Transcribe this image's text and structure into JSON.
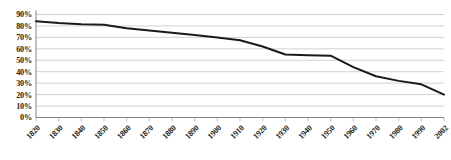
{
  "chart_data": {
    "type": "line",
    "title": "",
    "subtitle": "",
    "xlabel": "",
    "ylabel": "",
    "grid": true,
    "legend_position": "none",
    "xlim": [
      1820,
      2002
    ],
    "ylim": [
      0,
      90
    ],
    "ytick_labels": [
      "90%",
      "80%",
      "70%",
      "60%",
      "50%",
      "40%",
      "30%",
      "20%",
      "10%",
      "0%"
    ],
    "ytick_values": [
      90,
      80,
      70,
      60,
      50,
      40,
      30,
      20,
      10,
      0
    ],
    "xtick_labels": [
      "1820",
      "1830",
      "1840",
      "1850",
      "1860",
      "1870",
      "1880",
      "1890",
      "1900",
      "1910",
      "1920",
      "1930",
      "1940",
      "1950",
      "1960",
      "1970",
      "1980",
      "1990",
      "2002"
    ],
    "categories": [
      1820,
      1830,
      1840,
      1850,
      1860,
      1870,
      1880,
      1890,
      1900,
      1910,
      1920,
      1930,
      1940,
      1950,
      1960,
      1970,
      1980,
      1990,
      2002
    ],
    "series": [
      {
        "name": "",
        "color": "#1a1a1a",
        "values": [
          84,
          82.5,
          81.5,
          81,
          78,
          76,
          74,
          72,
          70,
          67.5,
          62,
          55,
          54.5,
          54,
          44,
          36,
          32,
          29,
          20
        ]
      }
    ],
    "annotations": []
  },
  "colors": {
    "line": "#1a1a1a",
    "gridline": "#bcbec0",
    "axis": "#808285",
    "tick": "#a7a9ac",
    "text": "#231f20",
    "background": "#ffffff"
  }
}
